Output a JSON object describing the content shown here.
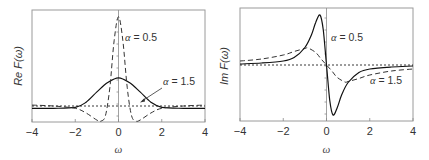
{
  "chart_data": [
    {
      "type": "line",
      "panel": "left",
      "title": "",
      "xlabel": "ω",
      "ylabel": "Re F(ω)",
      "xlim": [
        -4,
        4
      ],
      "xticks": [
        "-4",
        "-2",
        "0",
        "2",
        "4"
      ],
      "grid": false,
      "legend": "inline annotations",
      "annotations": [
        {
          "text_sym": "α",
          "text_val": " = 0.5",
          "attached_to": "dashed"
        },
        {
          "text_sym": "α",
          "text_val": " = 1.5",
          "attached_to": "solid",
          "arrow": true
        }
      ],
      "series": [
        {
          "name": "α = 0.5",
          "style": "dashed",
          "x": [
            -4,
            -3,
            -2,
            -1.5,
            -1,
            -0.8,
            -0.6,
            -0.4,
            -0.2,
            0,
            0.2,
            0.4,
            0.6,
            0.8,
            1,
            1.5,
            2,
            3,
            4
          ],
          "y": [
            0.02,
            0.0,
            -0.05,
            -0.15,
            -0.3,
            -0.35,
            -0.2,
            0.4,
            1.4,
            1.9,
            1.4,
            0.4,
            -0.2,
            -0.35,
            -0.3,
            -0.15,
            -0.05,
            0.0,
            0.02
          ]
        },
        {
          "name": "α = 1.5",
          "style": "solid",
          "x": [
            -4,
            -3,
            -2,
            -1.5,
            -1,
            -0.5,
            0,
            0.5,
            1,
            1.5,
            2,
            3,
            4
          ],
          "y": [
            -0.05,
            -0.05,
            -0.03,
            0.08,
            0.3,
            0.5,
            0.6,
            0.5,
            0.3,
            0.08,
            -0.03,
            -0.05,
            -0.05
          ]
        },
        {
          "name": "baseline",
          "style": "dotted",
          "x": [
            -4,
            4
          ],
          "y": [
            0,
            0
          ]
        }
      ]
    },
    {
      "type": "line",
      "panel": "right",
      "title": "",
      "xlabel": "ω",
      "ylabel": "Im F(ω)",
      "xlim": [
        -4,
        4
      ],
      "xticks": [
        "-4",
        "-2",
        "0",
        "2",
        "4"
      ],
      "grid": false,
      "legend": "inline annotations",
      "annotations": [
        {
          "text_sym": "α",
          "text_val": " = 0.5",
          "attached_to": "solid"
        },
        {
          "text_sym": "α",
          "text_val": " = 1.5",
          "attached_to": "dashed"
        }
      ],
      "series": [
        {
          "name": "α = 0.5",
          "style": "solid",
          "x": [
            -4,
            -3,
            -2,
            -1.5,
            -1,
            -0.7,
            -0.5,
            -0.3,
            -0.15,
            0,
            0.15,
            0.3,
            0.5,
            0.7,
            1,
            1.5,
            2,
            3,
            4
          ],
          "y": [
            0.02,
            0.04,
            0.08,
            0.15,
            0.35,
            0.6,
            0.85,
            1.0,
            0.7,
            0,
            -0.7,
            -1.0,
            -0.85,
            -0.6,
            -0.35,
            -0.15,
            -0.08,
            -0.04,
            -0.02
          ]
        },
        {
          "name": "α = 1.5",
          "style": "dashed",
          "x": [
            -4,
            -3,
            -2,
            -1.5,
            -1,
            -0.85,
            -0.5,
            -0.25,
            0,
            0.25,
            0.5,
            0.85,
            1,
            1.5,
            2,
            3,
            4
          ],
          "y": [
            0.08,
            0.12,
            0.2,
            0.27,
            0.33,
            0.34,
            0.25,
            0.12,
            0,
            -0.12,
            -0.25,
            -0.34,
            -0.33,
            -0.27,
            -0.2,
            -0.12,
            -0.08
          ]
        },
        {
          "name": "baseline",
          "style": "dotted",
          "x": [
            -4,
            4
          ],
          "y": [
            0,
            0
          ]
        }
      ]
    }
  ]
}
